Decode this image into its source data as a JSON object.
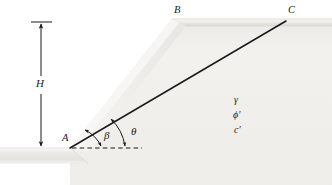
{
  "figure": {
    "type": "engineering-diagram",
    "width": 332,
    "height": 185,
    "background_color": "#ffffff"
  },
  "labels": {
    "point_a": "A",
    "point_b": "B",
    "point_c": "C",
    "height": "H",
    "angle_beta": "β",
    "angle_theta": "θ",
    "unit_weight": "γ",
    "friction_angle": "ϕ′",
    "cohesion": "c′"
  },
  "colors": {
    "line": "#1a1a1a",
    "soil_fill": "#efeeeb",
    "soil_fill_light": "#f7f6f4",
    "crest_band": "#e2e1dd",
    "ground_band": "#e6e5e1",
    "slope_face": "#f4f3f1",
    "background": "#ffffff"
  },
  "geometry": {
    "point_a": {
      "x": 70,
      "y": 148
    },
    "point_b_crest": {
      "x": 178,
      "y": 22
    },
    "point_c": {
      "x": 286,
      "y": 20
    },
    "crest_left": {
      "x": 172,
      "y": 19
    },
    "crest_right": {
      "x": 332,
      "y": 19
    },
    "dashed_baseline_end": {
      "x": 142,
      "y": 148
    },
    "dimension_line_x": 41,
    "dimension_top_y": 22,
    "dimension_bottom_y": 148,
    "ground_band_top": 148,
    "ground_band_bottom": 163
  },
  "annotations": {
    "beta_description": "Angle of slope face AB measured from horizontal",
    "theta_description": "Angle of trial failure plane AC measured from horizontal",
    "h_description": "Height of slope from toe A to crest B"
  }
}
